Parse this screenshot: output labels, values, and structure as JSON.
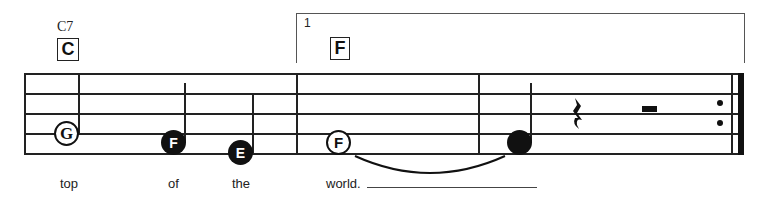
{
  "chords": [
    {
      "symbol": "C7",
      "box_letter": "C"
    },
    {
      "symbol": "",
      "box_letter": "F"
    }
  ],
  "ending": {
    "number": "1"
  },
  "notes": [
    {
      "letter": "G",
      "style": "open",
      "stem": "up"
    },
    {
      "letter": "F",
      "style": "filled",
      "stem": "up"
    },
    {
      "letter": "E",
      "style": "filled",
      "stem": "up"
    },
    {
      "letter": "F",
      "style": "open",
      "stem": "none",
      "tied_to_next": true
    },
    {
      "letter": "",
      "style": "filled",
      "stem": "up"
    }
  ],
  "rests": [
    "quarter-rest",
    "half-rest"
  ],
  "repeat": {
    "type": "end-repeat"
  },
  "lyrics": [
    "top",
    "of",
    "the",
    "world."
  ],
  "colors": {
    "ink": "#111111",
    "background": "#ffffff"
  }
}
